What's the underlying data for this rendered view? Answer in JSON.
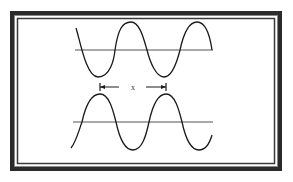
{
  "diagram": {
    "title": "",
    "measurement_label": "x",
    "colors": {
      "background": "#ffffff",
      "frame": "#2a2a2a",
      "ink": "#1a1a1a",
      "axis": "#555555"
    },
    "waves": [
      {
        "name": "top-wave",
        "baseline_y": 50,
        "amplitude": 28,
        "period_px": 66,
        "x_start": 76,
        "x_end": 212,
        "phase": "starts descending"
      },
      {
        "name": "bottom-wave",
        "baseline_y": 122,
        "amplitude": 28,
        "period_px": 66,
        "x_start": 71,
        "x_end": 212,
        "phase": "starts ascending from trough"
      }
    ],
    "dimension": {
      "from_x": 100,
      "to_x": 166,
      "y": 87,
      "label": "x"
    }
  }
}
